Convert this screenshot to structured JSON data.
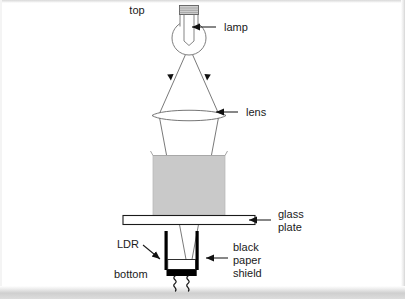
{
  "figure": {
    "kind": "physics-apparatus-diagram",
    "background_color": "#ffffff",
    "line_color": "#3a3a3a",
    "ink_color": "#1a1a1a",
    "block_fill_color": "#c9c9c9",
    "plate_fill_color": "#ffffff",
    "shield_fill_color": "#000000"
  },
  "labels": {
    "top": "top",
    "bottom": "bottom",
    "lamp": "lamp",
    "lens": "lens",
    "glass_plate_line1": "glass",
    "glass_plate_line2": "plate",
    "ldr": "LDR",
    "shield_line1": "black",
    "shield_line2": "paper",
    "shield_line3": "shield"
  },
  "components": [
    {
      "name": "lamp",
      "label": "lamp",
      "description": "incandescent bulb with screw cap and filament at the top of the apparatus"
    },
    {
      "name": "lens",
      "label": "lens",
      "description": "converging lens shown in cross-section as a thin lens ellipse"
    },
    {
      "name": "sample-block",
      "label": "",
      "description": "grey rectangular sample / container sitting on the glass plate"
    },
    {
      "name": "glass-plate",
      "label": "glass plate",
      "description": "thin horizontal transparent plate supporting the sample"
    },
    {
      "name": "ldr",
      "label": "LDR",
      "description": "light dependent resistor mounted under the glass plate"
    },
    {
      "name": "black-paper-shield",
      "label": "black paper shield",
      "description": "black tube of paper shielding the LDR from stray light"
    }
  ],
  "light_rays": {
    "count": 2,
    "direction": "downward from lamp through lens and sample onto the LDR",
    "arrowheads": 4
  },
  "orientation": {
    "top_marker": "top",
    "bottom_marker": "bottom"
  }
}
